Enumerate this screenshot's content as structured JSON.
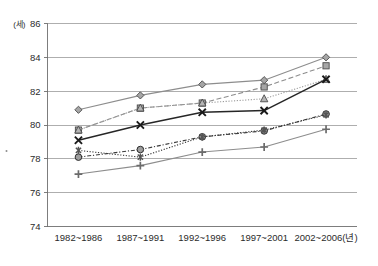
{
  "chart_data": {
    "type": "line",
    "title": "",
    "subtitle": "",
    "xlabel": "",
    "ylabel": "",
    "y_unit_label": "(세)",
    "x_unit_suffix": "(년)",
    "categories": [
      "1982~1986",
      "1987~1991",
      "1992~1996",
      "1997~2001",
      "2002~2006"
    ],
    "x_tick_labels": [
      "1982~1986",
      "1987~1991",
      "1992~1996",
      "1997~2001",
      "2002~2006(년)"
    ],
    "y_tick_labels": [
      "74",
      "76",
      "78",
      "80",
      "82",
      "84",
      "86"
    ],
    "y_ticks": [
      74,
      76,
      78,
      80,
      82,
      84,
      86
    ],
    "ylim": [
      74,
      86
    ],
    "grid": "horizontal",
    "legend": "none",
    "series": [
      {
        "name": "series-diamond",
        "marker": "diamond",
        "line_style": "solid",
        "color": "#8d8d8d",
        "values": [
          80.9,
          81.75,
          82.4,
          82.65,
          84.0
        ]
      },
      {
        "name": "series-square",
        "marker": "square",
        "line_style": "dashed",
        "color": "#8d8d8d",
        "values": [
          79.7,
          81.0,
          81.3,
          82.25,
          83.5
        ]
      },
      {
        "name": "series-triangle",
        "marker": "triangle",
        "line_style": "dotted",
        "color": "#9c9c9c",
        "values": [
          79.7,
          81.0,
          81.3,
          81.55,
          82.7
        ]
      },
      {
        "name": "series-cross",
        "marker": "x",
        "line_style": "solid",
        "color": "#262626",
        "values": [
          79.1,
          80.0,
          80.75,
          80.85,
          82.7
        ]
      },
      {
        "name": "series-circle",
        "marker": "circle",
        "line_style": "dash-dot",
        "color": "#3a3a3a",
        "values": [
          78.1,
          78.55,
          79.3,
          79.65,
          80.65
        ]
      },
      {
        "name": "series-asterisk",
        "marker": "asterisk",
        "line_style": "dotted",
        "color": "#3a3a3a",
        "values": [
          78.5,
          78.1,
          79.3,
          79.7,
          80.6
        ]
      },
      {
        "name": "series-plus",
        "marker": "plus",
        "line_style": "solid",
        "color": "#8d8d8d",
        "values": [
          77.1,
          77.6,
          78.4,
          78.7,
          79.75
        ]
      }
    ]
  }
}
